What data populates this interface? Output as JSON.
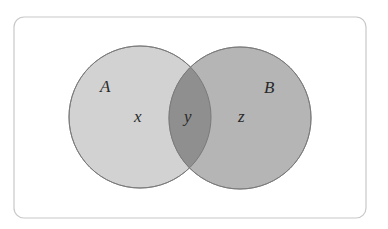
{
  "diagram": {
    "type": "venn",
    "sets": [
      {
        "label": "A",
        "fill": "#cfcfcf"
      },
      {
        "label": "B",
        "fill": "#b3b3b3"
      }
    ],
    "regions": {
      "a_only": "x",
      "intersection": "y",
      "b_only": "z"
    },
    "intersection_fill": "#8f8f8f",
    "border_color": "#c8c8c8"
  }
}
